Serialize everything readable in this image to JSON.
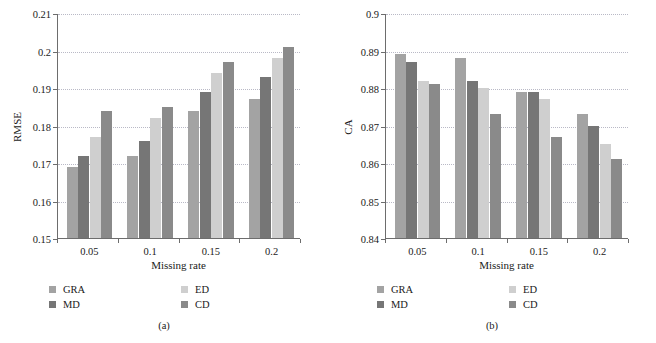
{
  "figure": {
    "width": 656,
    "height": 343,
    "background": "#ffffff"
  },
  "series_colors": {
    "GRA": "#a3a3a3",
    "MD": "#767676",
    "ED": "#cfcfcf",
    "CD": "#8a8a8a"
  },
  "legend": {
    "items": [
      {
        "label": "GRA",
        "color": "#a3a3a3"
      },
      {
        "label": "MD",
        "color": "#767676"
      },
      {
        "label": "ED",
        "color": "#cfcfcf"
      },
      {
        "label": "CD",
        "color": "#8a8a8a"
      }
    ]
  },
  "panels": [
    {
      "caption": "(a)"
    },
    {
      "caption": "(b)"
    }
  ],
  "chart_data": [
    {
      "type": "bar",
      "title": "",
      "panel_caption": "(a)",
      "xlabel": "Missing rate",
      "ylabel": "RMSE",
      "categories": [
        "0.05",
        "0.1",
        "0.15",
        "0.2"
      ],
      "ylim": [
        0.15,
        0.21
      ],
      "yticks": [
        0.15,
        0.16,
        0.17,
        0.18,
        0.19,
        0.2,
        0.21
      ],
      "ytick_labels": [
        "0.15",
        "0.16",
        "0.17",
        "0.18",
        "0.19",
        "0.2",
        "0.21"
      ],
      "grid": true,
      "grid_axis": "y",
      "legend_position": "below",
      "series": [
        {
          "name": "GRA",
          "color": "#a3a3a3",
          "values": [
            0.169,
            0.172,
            0.184,
            0.187
          ]
        },
        {
          "name": "MD",
          "color": "#767676",
          "values": [
            0.172,
            0.176,
            0.189,
            0.193
          ]
        },
        {
          "name": "ED",
          "color": "#cfcfcf",
          "values": [
            0.177,
            0.182,
            0.194,
            0.198
          ]
        },
        {
          "name": "CD",
          "color": "#8a8a8a",
          "values": [
            0.184,
            0.185,
            0.197,
            0.201
          ]
        }
      ]
    },
    {
      "type": "bar",
      "title": "",
      "panel_caption": "(b)",
      "xlabel": "Missing rate",
      "ylabel": "CA",
      "categories": [
        "0.05",
        "0.1",
        "0.15",
        "0.2"
      ],
      "ylim": [
        0.84,
        0.9
      ],
      "yticks": [
        0.84,
        0.85,
        0.86,
        0.87,
        0.88,
        0.89,
        0.9
      ],
      "ytick_labels": [
        "0.84",
        "0.85",
        "0.86",
        "0.87",
        "0.88",
        "0.89",
        "0.9"
      ],
      "grid": true,
      "grid_axis": "y",
      "legend_position": "below",
      "series": [
        {
          "name": "GRA",
          "color": "#a3a3a3",
          "values": [
            0.889,
            0.888,
            0.879,
            0.873
          ]
        },
        {
          "name": "MD",
          "color": "#767676",
          "values": [
            0.887,
            0.882,
            0.879,
            0.87
          ]
        },
        {
          "name": "ED",
          "color": "#cfcfcf",
          "values": [
            0.882,
            0.88,
            0.877,
            0.865
          ]
        },
        {
          "name": "CD",
          "color": "#8a8a8a",
          "values": [
            0.881,
            0.873,
            0.867,
            0.861
          ]
        }
      ]
    }
  ]
}
